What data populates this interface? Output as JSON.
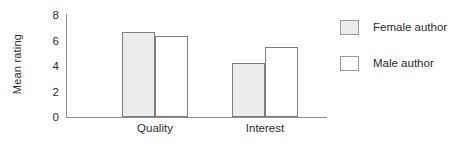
{
  "chart_data": {
    "type": "bar",
    "title": "",
    "xlabel": "",
    "ylabel": "Mean rating",
    "categories": [
      "Quality",
      "Interest"
    ],
    "series": [
      {
        "name": "Female author",
        "values": [
          6.6,
          4.2
        ],
        "fill": "#ececec"
      },
      {
        "name": "Male author",
        "values": [
          6.3,
          5.4
        ],
        "fill": "#ffffff"
      }
    ],
    "ylim": [
      0,
      8
    ],
    "yticks": [
      "0",
      "2",
      "4",
      "6",
      "8"
    ],
    "grid": false,
    "legend_position": "right"
  },
  "axis": {
    "y_label": "Mean rating",
    "y_ticks": [
      {
        "label": "8",
        "value": 8
      },
      {
        "label": "6",
        "value": 6
      },
      {
        "label": "4",
        "value": 4
      },
      {
        "label": "2",
        "value": 2
      },
      {
        "label": "0",
        "value": 0
      }
    ],
    "x_ticks": [
      {
        "label": "Quality"
      },
      {
        "label": "Interest"
      }
    ]
  },
  "legend": {
    "entries": [
      {
        "label": "Female author",
        "swatch": "female"
      },
      {
        "label": "Male author",
        "swatch": "male"
      }
    ]
  },
  "colors": {
    "bar_female_fill": "#ececec",
    "bar_male_fill": "#ffffff",
    "bar_border": "#7d7d7d",
    "axis_line": "#8d8d8d",
    "text": "#2b2b2b"
  }
}
